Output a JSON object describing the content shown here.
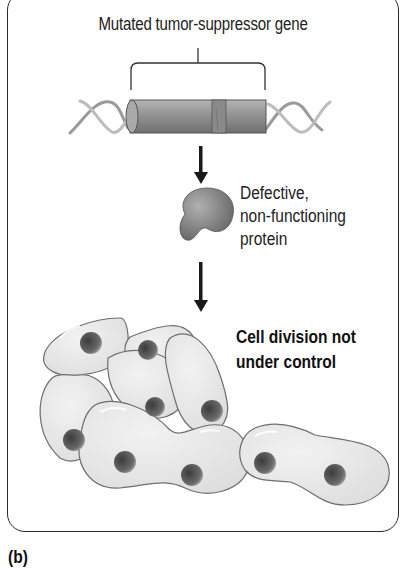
{
  "figure": {
    "panel_label": "(b)",
    "title": "Mutated tumor-suppressor gene",
    "steps": [
      {
        "id": "gene",
        "label": "Mutated tumor-suppressor gene",
        "icon": "dna-gene-segment-icon"
      },
      {
        "id": "protein",
        "label_lines": [
          "Defective,",
          "non-functioning",
          "protein"
        ],
        "icon": "protein-icon"
      },
      {
        "id": "cells",
        "label_lines": [
          "Cell division not",
          "under control"
        ],
        "icon": "dividing-cells-icon"
      }
    ],
    "arrows": [
      "gene-to-protein",
      "protein-to-cells"
    ],
    "colors": {
      "frame": "#2a2a2a",
      "cell_fill": "#e6e6e6",
      "cell_outline": "#6e6e6e",
      "nucleus": "#4a4a4a",
      "gene_cylinder": "#8f8f8f",
      "protein": "#7d7d7d",
      "arrow": "#1a1a1a"
    }
  }
}
